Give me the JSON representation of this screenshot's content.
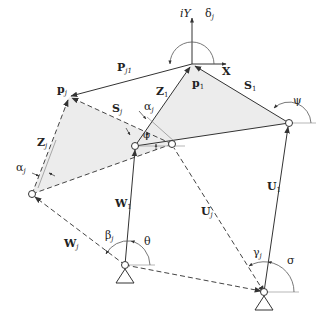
{
  "diagram": {
    "type": "planar linkage vector loop diagram",
    "colors": {
      "line": "#333333",
      "fill": "#ececec",
      "dash": "#444444"
    },
    "points": {
      "origin_p1": [
        192,
        64
      ],
      "p_j": [
        69,
        97
      ],
      "right_joint": [
        289,
        123
      ],
      "left_joint": [
        32,
        194
      ],
      "mid_left_joint": [
        135,
        146
      ],
      "mid_right_joint": [
        172,
        144
      ],
      "ground_left": [
        125,
        265
      ],
      "ground_right": [
        264,
        292
      ]
    },
    "labels": {
      "axis_y": {
        "main": "iY"
      },
      "axis_x": {
        "main": "X"
      },
      "delta_j": {
        "main": "δ",
        "sub": "j"
      },
      "P_j1": {
        "main": "P",
        "sub": "j1"
      },
      "p_1": {
        "main": "p",
        "sub": "1"
      },
      "p_j": {
        "main": "p",
        "sub": "j"
      },
      "Z_1": {
        "main": "Z",
        "sub": "1"
      },
      "S_1": {
        "main": "S",
        "sub": "1"
      },
      "S_j": {
        "main": "S",
        "sub": "j"
      },
      "Z_j": {
        "main": "Z",
        "sub": "j"
      },
      "alpha_j_top": {
        "main": "α",
        "sub": "j"
      },
      "alpha_j_left": {
        "main": "α",
        "sub": "j"
      },
      "phi": {
        "main": "φ"
      },
      "psi": {
        "main": "ψ"
      },
      "W_1": {
        "main": "W",
        "sub": "1"
      },
      "W_j": {
        "main": "W",
        "sub": "j"
      },
      "U_1": {
        "main": "U",
        "sub": "1"
      },
      "U_j": {
        "main": "U",
        "sub": "j"
      },
      "beta_j": {
        "main": "β",
        "sub": "j"
      },
      "theta": {
        "main": "θ"
      },
      "gamma_j": {
        "main": "γ",
        "sub": "j"
      },
      "sigma": {
        "main": "σ"
      }
    }
  }
}
